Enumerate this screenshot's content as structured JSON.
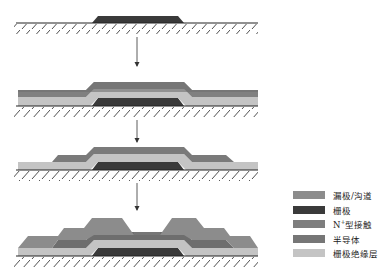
{
  "colors": {
    "source_drain": "#8c8c8c",
    "gate": "#3a3a3a",
    "n_plus_contact": "#7e7e7e",
    "semiconductor": "#767676",
    "gate_insulator": "#c4c4c4",
    "substrate_line": "#222222"
  },
  "steps": [
    {
      "index": 1,
      "description": "gate on substrate"
    },
    {
      "index": 2,
      "description": "gate insulator + semiconductor + N+ deposited"
    },
    {
      "index": 3,
      "description": "active island patterned"
    },
    {
      "index": 4,
      "description": "source/drain formed, channel opened"
    }
  ],
  "legend": {
    "items": [
      {
        "label": "漏极/沟道",
        "color": "#8c8c8c"
      },
      {
        "label": "栅极",
        "color": "#3a3a3a"
      },
      {
        "label": "N",
        "sup": "+",
        "suffix": "型接触",
        "color": "#7e7e7e"
      },
      {
        "label": "半导体",
        "color": "#767676"
      },
      {
        "label": "栅极绝缘层",
        "color": "#c4c4c4"
      }
    ]
  }
}
